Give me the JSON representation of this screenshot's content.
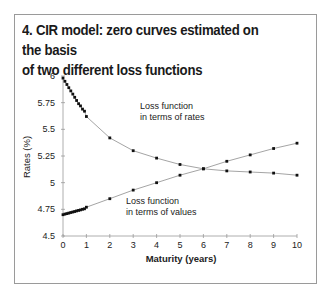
{
  "figure": {
    "title_line1": "4. CIR model: zero curves estimated on the basis",
    "title_line2": "of two different loss functions"
  },
  "chart_data": {
    "type": "line",
    "title": "4. CIR model: zero curves estimated on the basis of two different loss functions",
    "xlabel": "Maturity (years)",
    "ylabel": "Rates (%)",
    "xlim": [
      0,
      10
    ],
    "ylim": [
      4.5,
      6
    ],
    "x_ticks": [
      "0",
      "1",
      "2",
      "3",
      "4",
      "5",
      "6",
      "7",
      "8",
      "9",
      "10"
    ],
    "y_ticks": [
      "4.5",
      "4.75",
      "5",
      "5.25",
      "5.5",
      "5.75",
      "6"
    ],
    "grid": false,
    "legend": "inline annotations",
    "series": [
      {
        "name": "Loss function in terms of rates",
        "annotation_line1": "Loss function",
        "annotation_line2": "in terms of rates",
        "x": [
          0.0,
          0.083,
          0.167,
          0.25,
          0.333,
          0.417,
          0.5,
          0.583,
          0.667,
          0.75,
          0.833,
          0.917,
          1,
          2,
          3,
          4,
          5,
          6,
          7,
          8,
          9,
          10
        ],
        "values": [
          5.98,
          5.95,
          5.92,
          5.89,
          5.86,
          5.83,
          5.8,
          5.77,
          5.74,
          5.72,
          5.69,
          5.67,
          5.62,
          5.42,
          5.3,
          5.23,
          5.17,
          5.13,
          5.11,
          5.1,
          5.09,
          5.07
        ]
      },
      {
        "name": "Loss function in terms of values",
        "annotation_line1": "Loss function",
        "annotation_line2": "in terms of values",
        "x": [
          0.0,
          0.083,
          0.167,
          0.25,
          0.333,
          0.417,
          0.5,
          0.583,
          0.667,
          0.75,
          0.833,
          0.917,
          1,
          2,
          3,
          4,
          5,
          6,
          7,
          8,
          9,
          10
        ],
        "values": [
          4.7,
          4.705,
          4.71,
          4.715,
          4.72,
          4.725,
          4.73,
          4.735,
          4.74,
          4.745,
          4.75,
          4.755,
          4.77,
          4.85,
          4.93,
          5.0,
          5.07,
          5.13,
          5.2,
          5.26,
          5.32,
          5.37
        ]
      }
    ]
  }
}
